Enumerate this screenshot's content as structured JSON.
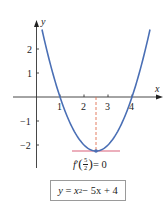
{
  "diagram": {
    "function": {
      "equation_label": {
        "lhs": "y",
        "x": "x",
        "exp": "2",
        "rest": " − 5x + 4"
      },
      "coefficients": {
        "a": 1,
        "b": -5,
        "c": 4
      }
    },
    "axes": {
      "x_label": "x",
      "y_label": "y",
      "x_ticks": [
        "1",
        "2",
        "3",
        "4"
      ],
      "y_ticks": [
        "2",
        "1",
        "−1",
        "−2"
      ]
    },
    "critical_point": {
      "x": 2.5,
      "y": -2.25,
      "annotation": {
        "f": "f",
        "prime": "′",
        "num": "5",
        "den": "2",
        "rhs": " = 0"
      }
    },
    "colors": {
      "curve": "#4a6fb5",
      "tangent_line": "#d9607a",
      "dashed_line": "#e07050",
      "axes": "#333333",
      "box_border": "#9a9a9a"
    }
  }
}
